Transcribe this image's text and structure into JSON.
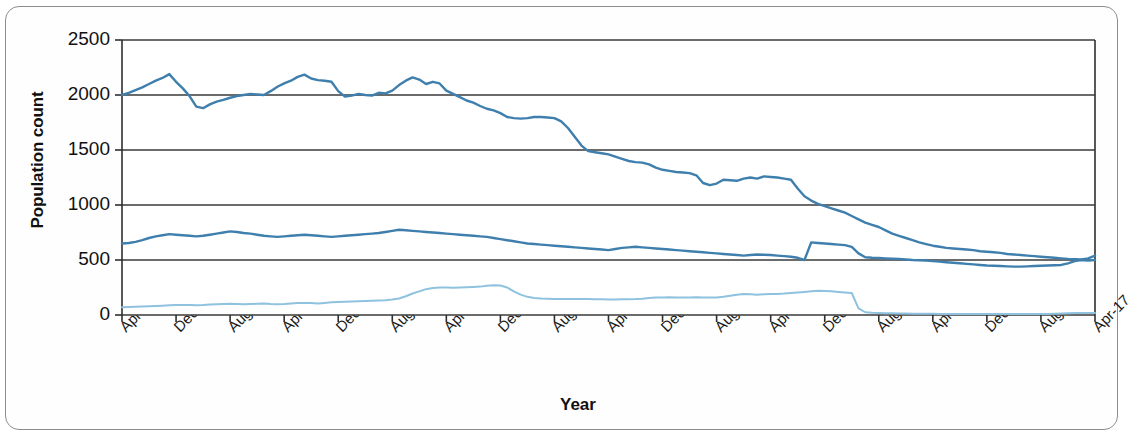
{
  "chart_data": {
    "type": "line",
    "title": "",
    "xlabel": "Year",
    "ylabel": "Population count",
    "ylim": [
      0,
      2500
    ],
    "y_ticks": [
      0,
      500,
      1000,
      1500,
      2000,
      2500
    ],
    "grid": true,
    "legend_position": "inline-labels",
    "x_tick_labels": [
      "Apr-05",
      "Dec-05",
      "Aug-06",
      "Apr-07",
      "Dec-07",
      "Aug-08",
      "Apr-09",
      "Dec-09",
      "Aug-10",
      "Apr-11",
      "Dec-11",
      "Aug-12",
      "Apr-13",
      "Dec-13",
      "Aug-14",
      "Apr-15",
      "Dec-15",
      "Aug-16",
      "Apr-17"
    ],
    "x_tick_interval_months": 8,
    "x_start": "Apr-05",
    "x_end": "Apr-17",
    "n_points": 145,
    "series": [
      {
        "name": "White",
        "color": "#3f7fad",
        "values": [
          2000,
          2020,
          2045,
          2070,
          2100,
          2130,
          2155,
          2190,
          2120,
          2060,
          1990,
          1895,
          1880,
          1915,
          1940,
          1955,
          1975,
          1990,
          2000,
          2010,
          2005,
          2000,
          2035,
          2075,
          2105,
          2130,
          2165,
          2185,
          2150,
          2135,
          2130,
          2120,
          2035,
          1985,
          1995,
          2010,
          2000,
          1995,
          2020,
          2015,
          2040,
          2090,
          2130,
          2160,
          2140,
          2100,
          2120,
          2105,
          2040,
          2010,
          1980,
          1950,
          1930,
          1900,
          1875,
          1860,
          1835,
          1800,
          1790,
          1785,
          1790,
          1800,
          1800,
          1795,
          1790,
          1760,
          1700,
          1620,
          1540,
          1490,
          1480,
          1470,
          1460,
          1440,
          1420,
          1400,
          1390,
          1385,
          1370,
          1340,
          1320,
          1310,
          1300,
          1295,
          1290,
          1270,
          1200,
          1180,
          1195,
          1230,
          1225,
          1220,
          1240,
          1250,
          1240,
          1260,
          1255,
          1250,
          1240,
          1230,
          1150,
          1080,
          1040,
          1010,
          990,
          970,
          950,
          930,
          900,
          870,
          840,
          820,
          800,
          770,
          740,
          720,
          700,
          680,
          660,
          645,
          630,
          620,
          610,
          605,
          600,
          595,
          590,
          580,
          575,
          570,
          565,
          555,
          550,
          545,
          540,
          535,
          530,
          525,
          520,
          515,
          510,
          508,
          505,
          515,
          540
        ]
      },
      {
        "name": "BAME",
        "color": "#3f7fad",
        "values": [
          650,
          655,
          665,
          680,
          700,
          715,
          725,
          735,
          730,
          725,
          720,
          715,
          720,
          730,
          740,
          750,
          760,
          755,
          745,
          740,
          730,
          720,
          715,
          710,
          715,
          720,
          725,
          730,
          725,
          720,
          715,
          710,
          715,
          720,
          725,
          730,
          735,
          740,
          745,
          755,
          765,
          775,
          770,
          765,
          760,
          755,
          750,
          745,
          740,
          735,
          730,
          725,
          720,
          715,
          710,
          700,
          690,
          680,
          670,
          660,
          650,
          645,
          640,
          635,
          630,
          625,
          620,
          615,
          610,
          605,
          600,
          595,
          590,
          600,
          610,
          615,
          620,
          615,
          610,
          605,
          600,
          595,
          590,
          585,
          580,
          575,
          570,
          565,
          560,
          555,
          550,
          545,
          540,
          545,
          550,
          548,
          545,
          540,
          535,
          530,
          520,
          500,
          660,
          655,
          650,
          645,
          640,
          635,
          620,
          560,
          525,
          520,
          518,
          515,
          512,
          510,
          505,
          500,
          498,
          495,
          490,
          485,
          480,
          475,
          470,
          465,
          460,
          455,
          450,
          448,
          445,
          442,
          440,
          440,
          442,
          445,
          448,
          450,
          452,
          455,
          470,
          490,
          500,
          495,
          500
        ]
      },
      {
        "name": "Unknown",
        "color": "#8ec2de",
        "values": [
          70,
          72,
          75,
          78,
          80,
          82,
          85,
          88,
          90,
          92,
          90,
          88,
          90,
          95,
          98,
          100,
          102,
          100,
          98,
          100,
          102,
          105,
          100,
          98,
          100,
          105,
          108,
          110,
          108,
          105,
          110,
          115,
          118,
          120,
          122,
          125,
          128,
          130,
          132,
          135,
          140,
          150,
          170,
          195,
          215,
          235,
          245,
          250,
          250,
          248,
          250,
          252,
          255,
          258,
          265,
          270,
          268,
          250,
          215,
          185,
          165,
          155,
          150,
          148,
          145,
          145,
          145,
          145,
          145,
          145,
          144,
          143,
          142,
          142,
          143,
          144,
          145,
          148,
          155,
          158,
          160,
          162,
          160,
          158,
          160,
          162,
          160,
          158,
          160,
          165,
          175,
          185,
          190,
          188,
          185,
          188,
          190,
          192,
          195,
          200,
          205,
          210,
          215,
          220,
          218,
          215,
          210,
          205,
          200,
          60,
          25,
          20,
          18,
          16,
          15,
          14,
          13,
          12,
          12,
          11,
          11,
          10,
          10,
          10,
          10,
          10,
          10,
          10,
          10,
          10,
          10,
          10,
          10,
          10,
          10,
          10,
          10,
          10,
          12,
          14,
          16,
          18,
          18,
          18,
          18
        ]
      }
    ],
    "series_label_positions": [
      {
        "name": "White",
        "x": 248,
        "y": 55
      },
      {
        "name": "BAME",
        "x": 242,
        "y": 196
      },
      {
        "name": "Unknown",
        "x": 236,
        "y": 278
      }
    ]
  },
  "axes": {
    "plot_left": 122,
    "plot_right": 1095,
    "plot_top": 40,
    "plot_bottom": 315
  }
}
